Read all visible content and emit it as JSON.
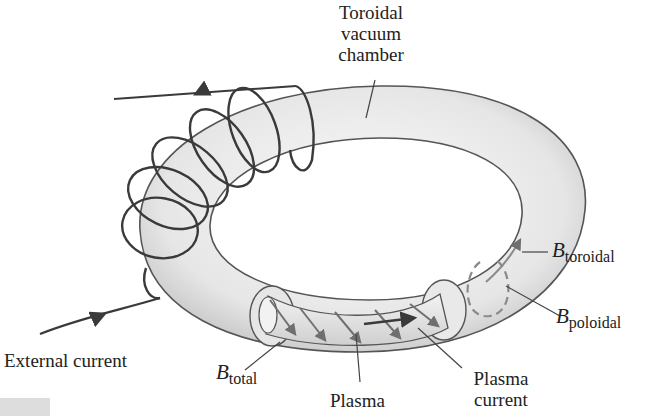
{
  "diagram": {
    "labels": {
      "chamber": [
        "Toroidal",
        "vacuum",
        "chamber"
      ],
      "external_current": "External current",
      "b_total": {
        "symbol": "B",
        "subscript": "total"
      },
      "b_toroidal": {
        "symbol": "B",
        "subscript": "toroidal"
      },
      "b_poloidal": {
        "symbol": "B",
        "subscript": "poloidal"
      },
      "plasma": "Plasma",
      "plasma_current": [
        "Plasma",
        "current"
      ]
    },
    "colors": {
      "torus_fill_light": "#f4f4f4",
      "torus_fill_dark": "#c8c8c8",
      "outline": "#555555",
      "coil": "#3a3a3a",
      "field_arrows": "#7a7a7a",
      "leader_lines": "#444444"
    }
  }
}
